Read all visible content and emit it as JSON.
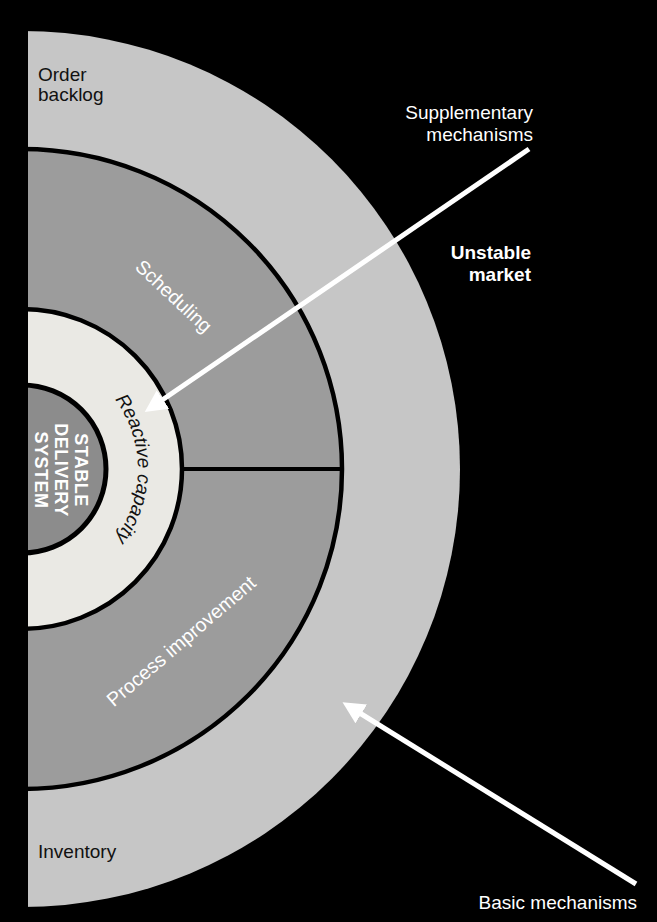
{
  "diagram": {
    "core": {
      "line1": "STABLE",
      "line2": "DELIVERY",
      "line3": "SYSTEM"
    },
    "rings": {
      "reactive_capacity": "Reactive capacity",
      "scheduling": "Scheduling",
      "process_improvement": "Process improvement",
      "order_backlog": {
        "line1": "Order",
        "line2": "backlog"
      },
      "inventory": "Inventory"
    },
    "annotations": {
      "supplementary": {
        "line1": "Supplementary",
        "line2": "mechanisms"
      },
      "unstable_market": {
        "line1": "Unstable",
        "line2": "market"
      },
      "basic_mechanisms": "Basic mechanisms"
    },
    "colors": {
      "background": "#000000",
      "outer_ring": "#c6c6c6",
      "middle_ring": "#9c9c9c",
      "reactive_ring": "#eae9e4",
      "core_circle": "#8c8c8c",
      "boundary_line": "#000000",
      "arrow": "#ffffff",
      "text_dark": "#111111",
      "text_light": "#ffffff"
    }
  }
}
